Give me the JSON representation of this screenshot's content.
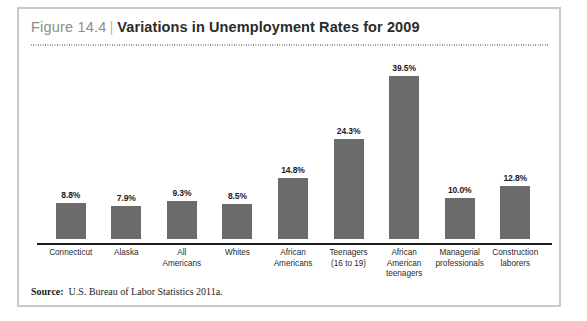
{
  "figure": {
    "number": "Figure 14.4",
    "separator": "|",
    "title": "Variations in Unemployment Rates for 2009"
  },
  "source": {
    "label": "Source:",
    "text": "U.S. Bureau of Labor Statistics 2011a."
  },
  "colors": {
    "bar_fill": "#6b6b6b",
    "axis": "#1c1c1c",
    "frame": "#c9c9c9",
    "figure_number": "#8d8d8d",
    "title": "#2b2b2b"
  },
  "chart_data": {
    "type": "bar",
    "title": "Variations in Unemployment Rates for 2009",
    "xlabel": "",
    "ylabel": "",
    "ylim": [
      0,
      44
    ],
    "grid": false,
    "legend": "none",
    "categories": [
      "Connecticut",
      "Alaska",
      "All Americans",
      "Whites",
      "African Americans",
      "Teenagers (16 to 19)",
      "African American teenagers",
      "Managerial professionals",
      "Construction laborers"
    ],
    "category_lines": [
      [
        "Connecticut"
      ],
      [
        "Alaska"
      ],
      [
        "All",
        "Americans"
      ],
      [
        "Whites"
      ],
      [
        "African",
        "Americans"
      ],
      [
        "Teenagers",
        "(16 to 19)"
      ],
      [
        "African",
        "American",
        "teenagers"
      ],
      [
        "Managerial",
        "professionals"
      ],
      [
        "Construction",
        "laborers"
      ]
    ],
    "values": [
      8.8,
      7.9,
      9.3,
      8.5,
      14.8,
      24.3,
      39.5,
      10.0,
      12.8
    ],
    "value_labels": [
      "8.8%",
      "7.9%",
      "9.3%",
      "8.5%",
      "14.8%",
      "24.3%",
      "39.5%",
      "10.0%",
      "12.8%"
    ]
  }
}
